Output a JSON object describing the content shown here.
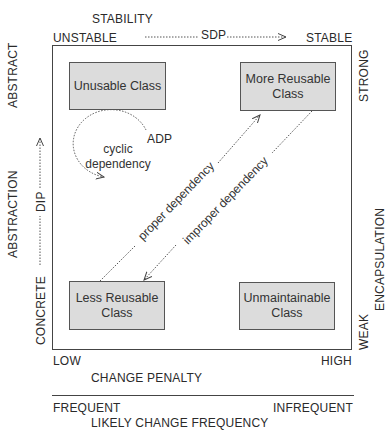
{
  "top_axis": {
    "title": "STABILITY",
    "left": "UNSTABLE",
    "right": "STABLE",
    "principle": "SDP"
  },
  "left_axis": {
    "title": "ABSTRACTION",
    "top": "ABSTRACT",
    "bottom": "CONCRETE",
    "principle": "DIP"
  },
  "right_axis": {
    "title": "ENCAPSULATION",
    "top": "STRONG",
    "bottom": "WEAK"
  },
  "bottom_axis_1": {
    "title": "CHANGE PENALTY",
    "left": "LOW",
    "right": "HIGH"
  },
  "bottom_axis_2": {
    "title": "LIKELY CHANGE FREQUENCY",
    "left": "FREQUENT",
    "right": "INFREQUENT"
  },
  "classes": {
    "top_left": "Unusable Class",
    "top_right_line1": "More Reusable",
    "top_right_line2": "Class",
    "bottom_left_line1": "Less Reusable",
    "bottom_left_line2": "Class",
    "bottom_right_line1": "Unmaintainable",
    "bottom_right_line2": "Class"
  },
  "annotations": {
    "adp": "ADP",
    "cyclic_line1": "cyclic",
    "cyclic_line2": "dependency",
    "proper": "proper dependency",
    "improper": "improper dependency"
  },
  "colors": {
    "box_fill": "#dcdcdc",
    "line": "#444444"
  }
}
